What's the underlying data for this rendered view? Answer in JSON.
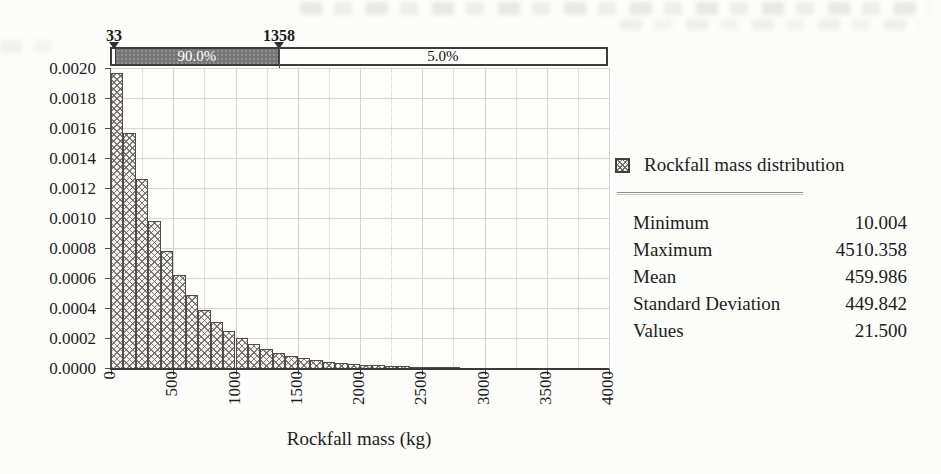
{
  "chart_data": {
    "type": "bar",
    "title": "",
    "xlabel": "Rockfall mass (kg)",
    "ylabel": "",
    "xlim": [
      0,
      4000
    ],
    "ylim": [
      0,
      0.002
    ],
    "grid": "on",
    "x_ticks": [
      "0",
      "500",
      "1000",
      "1500",
      "2000",
      "2500",
      "3000",
      "3500",
      "4000"
    ],
    "y_ticks": [
      "0.0020",
      "0.0018",
      "0.0016",
      "0.0014",
      "0.0012",
      "0.0010",
      "0.0008",
      "0.0006",
      "0.0004",
      "0.0002",
      "0.0000"
    ],
    "bin_start": 0,
    "bin_width": 100,
    "values": [
      0.00197,
      0.00157,
      0.00126,
      0.00098,
      0.00078,
      0.00062,
      0.00049,
      0.00039,
      0.00031,
      0.00025,
      0.0002,
      0.00016,
      0.000128,
      0.000103,
      8.2e-05,
      6.6e-05,
      5.3e-05,
      4.2e-05,
      3.4e-05,
      2.7e-05,
      2.2e-05,
      1.7e-05,
      1.4e-05,
      1.1e-05,
      9e-06,
      7e-06,
      6e-06,
      5e-06
    ],
    "legend": {
      "label": "Rockfall mass distribution",
      "position": "right",
      "swatch": "crosshatch-pattern"
    },
    "percentile_band": {
      "left_marker_value": "33",
      "right_marker_value": "1358",
      "left_marker_x": 33,
      "right_marker_x": 1358,
      "middle_label": "90.0%",
      "right_label": "5.0%"
    },
    "stats": [
      {
        "label": "Minimum",
        "value": "10.004"
      },
      {
        "label": "Maximum",
        "value": "4510.358"
      },
      {
        "label": "Mean",
        "value": "459.986"
      },
      {
        "label": "Standard Deviation",
        "value": "449.842"
      },
      {
        "label": "Values",
        "value": "21.500"
      }
    ]
  },
  "colors": {
    "band_dark": "#767676",
    "band_text_light": "#ffffff",
    "axis": "#3a3a3a",
    "gridline": "#d3d6d2",
    "bar_border": "#4d4d4d",
    "bar_fill": "#f4f3ef",
    "hatch": "#5f5f5f"
  }
}
